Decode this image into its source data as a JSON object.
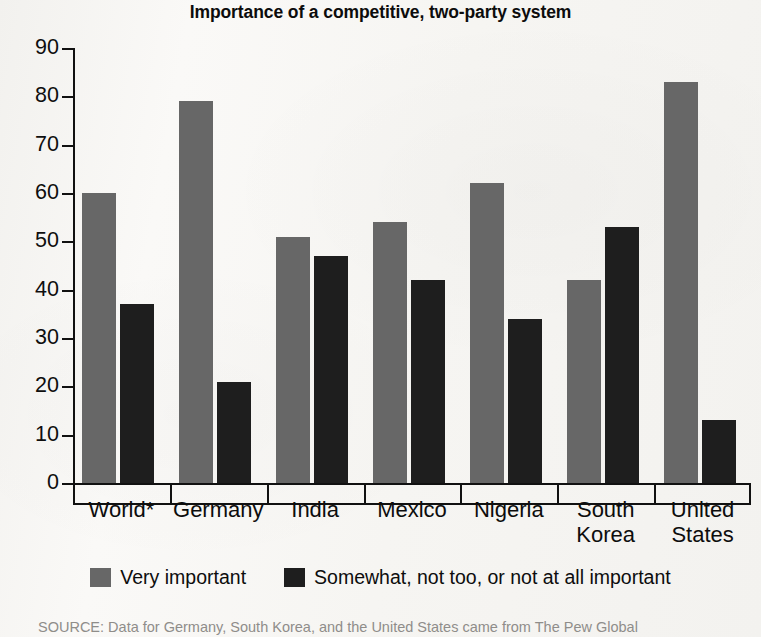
{
  "chart_data": {
    "type": "bar",
    "title": "Importance of a competitive, two-party system",
    "xlabel": "",
    "ylabel": "",
    "ylim": [
      0,
      90
    ],
    "yticks": [
      0,
      10,
      20,
      30,
      40,
      50,
      60,
      70,
      80,
      90
    ],
    "grid": false,
    "legend_position": "bottom",
    "categories": [
      "World*",
      "Germany",
      "India",
      "Mexico",
      "Nigeria",
      "South Korea",
      "United States"
    ],
    "series": [
      {
        "name": "Very important",
        "color": "#676767",
        "values": [
          60,
          79,
          51,
          54,
          62,
          42,
          83
        ]
      },
      {
        "name": "Somewhat, not too, or not at all important",
        "color": "#1e1e1e",
        "values": [
          37,
          21,
          47,
          42,
          34,
          53,
          13
        ]
      }
    ],
    "source_note": "SOURCE: Data for Germany, South Korea, and the United States came from The Pew Global"
  },
  "colors": {
    "series_very_important": "#676767",
    "series_somewhat": "#1e1e1e",
    "axis": "#111111",
    "page_background": "#f7f6f3"
  }
}
